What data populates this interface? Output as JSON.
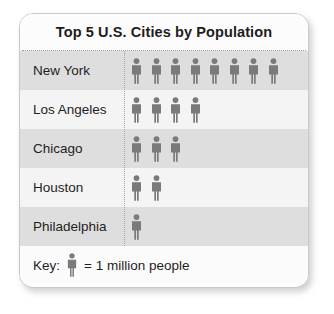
{
  "chart_data": {
    "type": "bar",
    "subtype": "pictograph",
    "title": "Top 5 U.S. Cities by Population",
    "categories": [
      "New York",
      "Los Angeles",
      "Chicago",
      "Houston",
      "Philadelphia"
    ],
    "values": [
      8,
      4,
      3,
      2,
      1
    ],
    "unit_value": 1,
    "unit_label": "million people",
    "icon": "person-icon",
    "xlabel": "",
    "ylabel": "",
    "legend": "Key:  = 1 million people",
    "grid": false,
    "rows": [
      {
        "label": "New York",
        "count": 8
      },
      {
        "label": "Los Angeles",
        "count": 4
      },
      {
        "label": "Chicago",
        "count": 3
      },
      {
        "label": "Houston",
        "count": 2
      },
      {
        "label": "Philadelphia",
        "count": 1
      }
    ]
  },
  "chart": {
    "title": "Top 5 U.S. Cities by Population",
    "key_prefix": "Key:",
    "key_suffix": "= 1 million people"
  },
  "colors": {
    "figure": "#7a7a7a",
    "row_shade_dark": "#dedede",
    "row_shade_light": "#f4f4f4",
    "card_border": "#c9c9c9",
    "text": "#1e1e1e"
  }
}
